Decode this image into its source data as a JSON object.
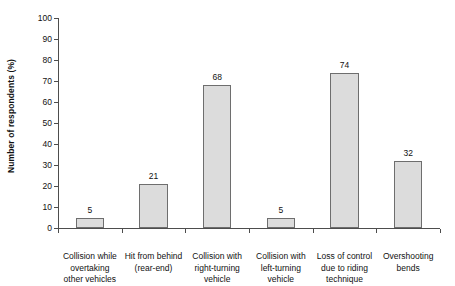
{
  "chart_data": {
    "type": "bar",
    "title": "",
    "xlabel": "",
    "ylabel": "Number of respondents (%)",
    "ylim": [
      0,
      100
    ],
    "ytick_step": 10,
    "grid": false,
    "legend": "none",
    "bar_fill_color": "#dcdcdc",
    "bar_border_color": "#6e6e6e",
    "axis_color": "#4d4d4d",
    "categories": [
      "Collision while overtaking other vehicles",
      "Hit from behind (rear-end)",
      "Collision with right-turning vehicle",
      "Collision with left-turning vehicle",
      "Loss of control due to riding technique",
      "Overshooting bends"
    ],
    "category_lines": [
      [
        "Collision while",
        "overtaking",
        "other vehicles"
      ],
      [
        "Hit from behind",
        "(rear-end)"
      ],
      [
        "Collision with",
        "right-turning",
        "vehicle"
      ],
      [
        "Collision with",
        "left-turning",
        "vehicle"
      ],
      [
        "Loss of control",
        "due to riding",
        "technique"
      ],
      [
        "Overshooting",
        "bends"
      ]
    ],
    "values": [
      5,
      21,
      68,
      5,
      74,
      32
    ],
    "value_labels": [
      "5",
      "21",
      "68",
      "5",
      "74",
      "32"
    ],
    "ytick_labels": [
      "0",
      "10",
      "20",
      "30",
      "40",
      "50",
      "60",
      "70",
      "80",
      "90",
      "100"
    ]
  }
}
